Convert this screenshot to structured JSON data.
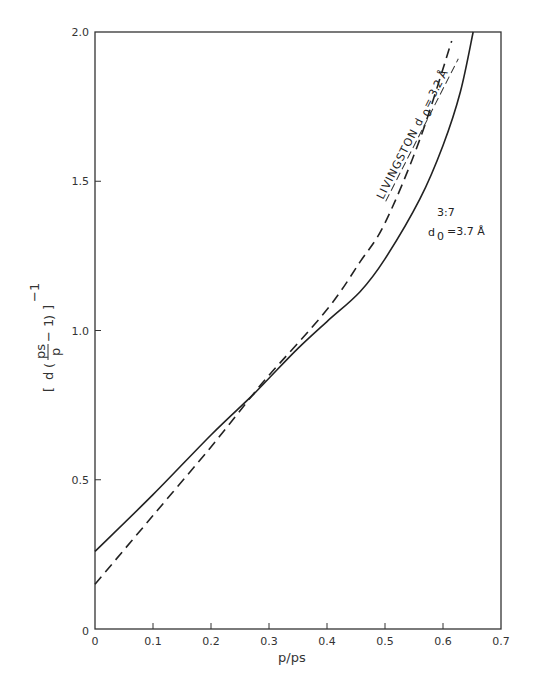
{
  "chart_data": {
    "type": "line",
    "title": "",
    "xlabel": "p/ps",
    "ylabel": "[ d ( ps/p − 1 ) ]⁻¹",
    "xlim": [
      0,
      0.7
    ],
    "ylim": [
      0,
      2.0
    ],
    "grid": false,
    "x_ticks": [
      "0",
      "0.1",
      "0.2",
      "0.3",
      "0.4",
      "0.5",
      "0.6",
      "0.7"
    ],
    "y_ticks": [
      "0",
      "0.5",
      "1.0",
      "1.5",
      "2.0"
    ],
    "series": [
      {
        "name": "3:7  d0 = 3.7 Å",
        "style": "solid",
        "x": [
          0,
          0.1,
          0.2,
          0.27,
          0.3,
          0.35,
          0.4,
          0.457,
          0.5,
          0.56,
          0.6,
          0.63,
          0.652
        ],
        "y": [
          0.26,
          0.45,
          0.65,
          0.78,
          0.84,
          0.94,
          1.03,
          1.13,
          1.24,
          1.44,
          1.62,
          1.8,
          2.0
        ]
      },
      {
        "name": "LIVINGSTON d0 = 3.2 Å",
        "style": "dashed",
        "x": [
          0,
          0.1,
          0.2,
          0.27,
          0.3,
          0.4,
          0.457,
          0.5,
          0.56,
          0.615
        ],
        "y": [
          0.15,
          0.38,
          0.61,
          0.78,
          0.85,
          1.07,
          1.23,
          1.36,
          1.64,
          1.97
        ]
      }
    ],
    "annotations": [
      {
        "text": "LIVINGSTON d0 = 3.2 Å",
        "target": "dashed"
      },
      {
        "text": "3:7",
        "target": "solid"
      },
      {
        "text": "d0 = 3.7 Å",
        "target": "solid"
      }
    ]
  },
  "labels": {
    "xlabel": "p/ps",
    "annot_livingston": "LIVINGSTON d",
    "annot_livingston_sub": "0",
    "annot_livingston_val": "= 3.2 Å",
    "annot_ratio": "3:7",
    "annot_d": "d",
    "annot_d_sub": "0",
    "annot_d_val": "=3.7 Å",
    "ylabel_d": "d",
    "ylabel_ps": "ps",
    "ylabel_p": "p",
    "ylabel_minus1": "− 1",
    "ylabel_exp": "−1"
  }
}
